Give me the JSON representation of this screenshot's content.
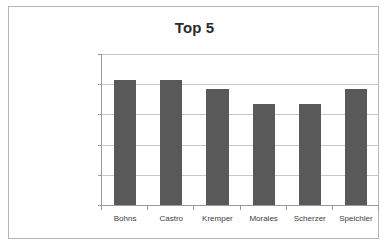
{
  "chart_data": {
    "type": "bar",
    "title": "Top 5",
    "xlabel": "",
    "ylabel": "",
    "categories": [
      "Bohns",
      "Castro",
      "Kremper",
      "Morales",
      "Scherzer",
      "Speichler"
    ],
    "values": [
      20700000,
      20700000,
      19200000,
      16700000,
      16700000,
      19200000
    ],
    "series": [
      {
        "name": "Top 5",
        "values": [
          20700000,
          20700000,
          19200000,
          16700000,
          16700000,
          19200000
        ]
      }
    ],
    "ylim": [
      0,
      25000000
    ],
    "ytick_values": [
      0,
      5000000,
      10000000,
      15000000,
      20000000,
      25000000
    ],
    "ytick_labels": [
      "0,00 €",
      "5.000.000,00 €",
      "10.000.000,00 €",
      "15.000.000,00 €",
      "20.000.000,00 €",
      "25.000.000,00 €"
    ],
    "grid": true,
    "legend": false,
    "legend_position": "none",
    "bar_color": "#595959",
    "gridline_color": "#c8c8c8",
    "axis_color": "#9a9a9a",
    "plot_background": "#ffffff",
    "border_color": "#b6b6b6"
  }
}
